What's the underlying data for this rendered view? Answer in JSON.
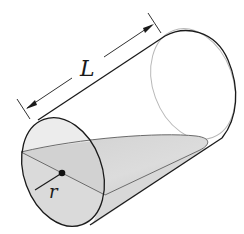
{
  "figure": {
    "labels": {
      "length": "L",
      "radius": "r"
    },
    "colors": {
      "outline": "#1a1a1a",
      "back_rim": "#b8b8b8",
      "wedge_fill": "#d4d4d4",
      "front_face_fill": "#e6e6e6",
      "wedge_edge": "#6b6b6b",
      "background": "#ffffff"
    }
  }
}
